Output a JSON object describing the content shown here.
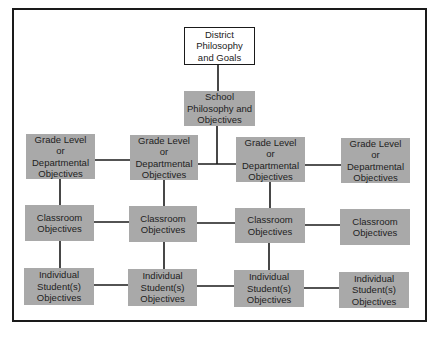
{
  "diagram": {
    "title": "",
    "colors": {
      "box_fill": "#a9a9a9",
      "top_box_fill": "#ffffff",
      "line": "#1a1a1a",
      "text": "#222222"
    },
    "nodes": {
      "district": {
        "lines": [
          "District",
          "Philosophy",
          "and Goals"
        ]
      },
      "school": {
        "lines": [
          "School",
          "Philosophy and",
          "Objectives"
        ]
      },
      "grade": [
        {
          "lines": [
            "Grade Level",
            "or",
            "Departmental",
            "Objectives"
          ]
        },
        {
          "lines": [
            "Grade Level",
            "or",
            "Departmental",
            "Objectives"
          ]
        },
        {
          "lines": [
            "Grade Level",
            "or",
            "Departmental",
            "Objectives"
          ]
        },
        {
          "lines": [
            "Grade Level",
            "or",
            "Departmental",
            "Objectives"
          ]
        }
      ],
      "classroom": [
        {
          "lines": [
            "Classroom",
            "Objectives"
          ]
        },
        {
          "lines": [
            "Classroom",
            "Objectives"
          ]
        },
        {
          "lines": [
            "Classroom",
            "Objectives"
          ]
        },
        {
          "lines": [
            "Classroom",
            "Objectives"
          ]
        }
      ],
      "individual": [
        {
          "lines": [
            "Individual",
            "Student(s)",
            "Objectives"
          ]
        },
        {
          "lines": [
            "Individual",
            "Student(s)",
            "Objectives"
          ]
        },
        {
          "lines": [
            "Individual",
            "Student(s)",
            "Objectives"
          ]
        },
        {
          "lines": [
            "Individual",
            "Student(s)",
            "Objectives"
          ]
        }
      ]
    },
    "edges": [
      [
        "district",
        "school"
      ],
      [
        "school",
        "grade-row-connector"
      ],
      [
        "grade.0",
        "grade.1"
      ],
      [
        "grade.1",
        "grade.2"
      ],
      [
        "grade.2",
        "grade.3"
      ],
      [
        "grade.0",
        "classroom.0"
      ],
      [
        "grade.1",
        "classroom.1"
      ],
      [
        "grade.2",
        "classroom.2"
      ],
      [
        "classroom.0",
        "classroom.1"
      ],
      [
        "classroom.1",
        "classroom.2"
      ],
      [
        "classroom.2",
        "classroom.3"
      ],
      [
        "classroom.0",
        "individual.0"
      ],
      [
        "classroom.1",
        "individual.1"
      ],
      [
        "classroom.2",
        "individual.2"
      ],
      [
        "individual.0",
        "individual.1"
      ],
      [
        "individual.1",
        "individual.2"
      ],
      [
        "individual.2",
        "individual.3"
      ]
    ]
  }
}
